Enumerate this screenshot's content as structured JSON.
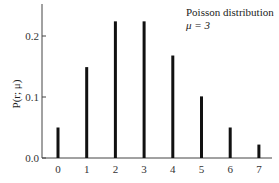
{
  "chart_data": {
    "type": "bar",
    "title": "Poisson distribution",
    "subtitle": "μ = 3",
    "xlabel": "",
    "ylabel": "P(r; μ)",
    "categories": [
      "0",
      "1",
      "2",
      "3",
      "4",
      "5",
      "6",
      "7"
    ],
    "values": [
      0.05,
      0.149,
      0.224,
      0.224,
      0.168,
      0.101,
      0.05,
      0.022
    ],
    "yticks": [
      "0.0",
      "0.1",
      "0.2"
    ],
    "ylim": [
      0,
      0.26
    ],
    "grid": false,
    "legend": "none",
    "bar_color": "#111111"
  }
}
